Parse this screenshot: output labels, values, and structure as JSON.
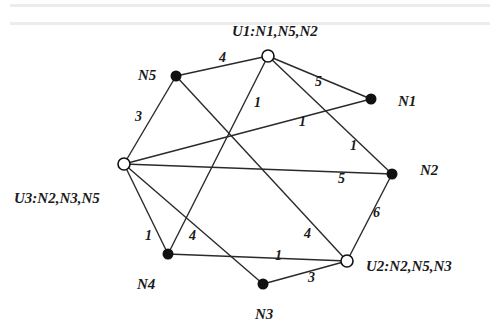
{
  "diagram": {
    "type": "weighted-graph",
    "colors": {
      "line": "#2a2a2a",
      "filled_node": "#111111",
      "open_node_fill": "#ffffff",
      "text": "#1a1a1a"
    },
    "nodes": [
      {
        "id": "U1",
        "label": "U1:N1,N5,N2",
        "x": 268,
        "y": 56,
        "kind": "open",
        "lx": 232,
        "ly": 36
      },
      {
        "id": "N5",
        "label": "N5",
        "x": 176,
        "y": 76,
        "kind": "filled",
        "lx": 138,
        "ly": 80
      },
      {
        "id": "N1",
        "label": "N1",
        "x": 371,
        "y": 99,
        "kind": "filled",
        "lx": 398,
        "ly": 106
      },
      {
        "id": "N2",
        "label": "N2",
        "x": 392,
        "y": 174,
        "kind": "filled",
        "lx": 420,
        "ly": 175
      },
      {
        "id": "U3",
        "label": "U3:N2,N3,N5",
        "x": 124,
        "y": 164,
        "kind": "open",
        "lx": 14,
        "ly": 203
      },
      {
        "id": "N4",
        "label": "N4",
        "x": 168,
        "y": 254,
        "kind": "filled",
        "lx": 137,
        "ly": 289
      },
      {
        "id": "N3",
        "label": "N3",
        "x": 263,
        "y": 284,
        "kind": "filled",
        "lx": 255,
        "ly": 319
      },
      {
        "id": "U2",
        "label": "U2:N2,N5,N3",
        "x": 347,
        "y": 261,
        "kind": "open",
        "lx": 366,
        "ly": 271
      }
    ],
    "edges": [
      {
        "from": "N5",
        "to": "U1",
        "weight": "4",
        "wx": 219,
        "wy": 62
      },
      {
        "from": "U1",
        "to": "N1",
        "weight": "5",
        "wx": 315,
        "wy": 86
      },
      {
        "from": "U1",
        "to": "N4",
        "weight": "1",
        "wx": 254,
        "wy": 107
      },
      {
        "from": "U1",
        "to": "N2",
        "weight": "1",
        "wx": 350,
        "wy": 150
      },
      {
        "from": "N5",
        "to": "U3",
        "weight": "3",
        "wx": 135,
        "wy": 121
      },
      {
        "from": "N5",
        "to": "U2",
        "weight": "4",
        "wx": 304,
        "wy": 238
      },
      {
        "from": "U3",
        "to": "N1",
        "weight": "1",
        "wx": 299,
        "wy": 126
      },
      {
        "from": "U3",
        "to": "N2",
        "weight": "5",
        "wx": 338,
        "wy": 183
      },
      {
        "from": "U3",
        "to": "N4",
        "weight": "1",
        "wx": 145,
        "wy": 240
      },
      {
        "from": "U3",
        "to": "N3",
        "weight": "4",
        "wx": 189,
        "wy": 240
      },
      {
        "from": "N4",
        "to": "U2",
        "weight": "1",
        "wx": 275,
        "wy": 260
      },
      {
        "from": "N3",
        "to": "U2",
        "weight": "3",
        "wx": 308,
        "wy": 282
      },
      {
        "from": "N2",
        "to": "U2",
        "weight": "6",
        "wx": 373,
        "wy": 217
      }
    ]
  }
}
